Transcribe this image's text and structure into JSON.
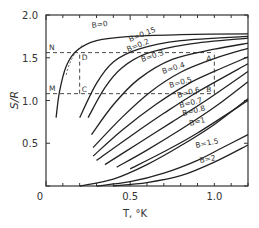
{
  "chart_data": {
    "type": "line",
    "title": "",
    "xlabel": "T, °K",
    "ylabel": "S/R",
    "xlim": [
      0,
      1.2
    ],
    "ylim": [
      0,
      2.0
    ],
    "x_ticks": [
      {
        "v": 0,
        "label": "0"
      },
      {
        "v": 0.5,
        "label": "0.5"
      },
      {
        "v": 1.0,
        "label": "1.0"
      }
    ],
    "y_ticks": [
      {
        "v": 0.5,
        "label": "0.5"
      },
      {
        "v": 1.0,
        "label": "1.0"
      },
      {
        "v": 1.5,
        "label": "1.5"
      },
      {
        "v": 2.0,
        "label": "2.0"
      }
    ],
    "grid": false,
    "series": [
      {
        "name": "B=0",
        "label": "B=0",
        "points": [
          [
            0.06,
            0.8
          ],
          [
            0.08,
            1.1
          ],
          [
            0.12,
            1.4
          ],
          [
            0.18,
            1.58
          ],
          [
            0.3,
            1.7
          ],
          [
            0.5,
            1.75
          ],
          [
            0.8,
            1.77
          ],
          [
            1.2,
            1.78
          ]
        ]
      },
      {
        "name": "B=0.15",
        "label": "B=0.15",
        "points": [
          [
            0.2,
            0.8
          ],
          [
            0.3,
            1.2
          ],
          [
            0.4,
            1.45
          ],
          [
            0.55,
            1.6
          ],
          [
            0.8,
            1.7
          ],
          [
            1.2,
            1.75
          ]
        ]
      },
      {
        "name": "B=0.2",
        "label": "B=0.2",
        "points": [
          [
            0.25,
            0.8
          ],
          [
            0.35,
            1.15
          ],
          [
            0.45,
            1.38
          ],
          [
            0.6,
            1.55
          ],
          [
            0.85,
            1.66
          ],
          [
            1.2,
            1.73
          ]
        ]
      },
      {
        "name": "B=0.3",
        "label": "B=0.3",
        "points": [
          [
            0.27,
            0.6
          ],
          [
            0.4,
            0.95
          ],
          [
            0.55,
            1.25
          ],
          [
            0.75,
            1.48
          ],
          [
            1.0,
            1.6
          ],
          [
            1.2,
            1.67
          ]
        ]
      },
      {
        "name": "B=0.4",
        "label": "B=0.4",
        "points": [
          [
            0.28,
            0.45
          ],
          [
            0.45,
            0.8
          ],
          [
            0.62,
            1.1
          ],
          [
            0.8,
            1.33
          ],
          [
            1.0,
            1.49
          ],
          [
            1.2,
            1.61
          ]
        ]
      },
      {
        "name": "B=0.5",
        "label": "B=0.5",
        "points": [
          [
            0.28,
            0.35
          ],
          [
            0.45,
            0.65
          ],
          [
            0.65,
            0.95
          ],
          [
            0.85,
            1.2
          ],
          [
            1.0,
            1.34
          ],
          [
            1.2,
            1.51
          ]
        ]
      },
      {
        "name": "B=0.6",
        "label": "B=0.6",
        "points": [
          [
            0.3,
            0.3
          ],
          [
            0.5,
            0.58
          ],
          [
            0.7,
            0.85
          ],
          [
            0.9,
            1.1
          ],
          [
            1.2,
            1.43
          ]
        ]
      },
      {
        "name": "B=0.7",
        "label": "B=0.7",
        "points": [
          [
            0.35,
            0.25
          ],
          [
            0.55,
            0.5
          ],
          [
            0.75,
            0.75
          ],
          [
            0.95,
            1.0
          ],
          [
            1.2,
            1.34
          ]
        ]
      },
      {
        "name": "B=0.8",
        "label": "B=0.8",
        "points": [
          [
            0.42,
            0.22
          ],
          [
            0.6,
            0.42
          ],
          [
            0.8,
            0.66
          ],
          [
            1.0,
            0.92
          ],
          [
            1.2,
            1.22
          ]
        ]
      },
      {
        "name": "B=0.9",
        "label": "",
        "points": [
          [
            0.5,
            0.2
          ],
          [
            0.7,
            0.4
          ],
          [
            0.9,
            0.62
          ],
          [
            1.2,
            1.0
          ]
        ]
      },
      {
        "name": "B=1",
        "label": "B=1",
        "points": [
          [
            0.2,
            0.0
          ],
          [
            0.4,
            0.08
          ],
          [
            0.6,
            0.25
          ],
          [
            0.8,
            0.47
          ],
          [
            1.0,
            0.72
          ],
          [
            1.2,
            1.02
          ]
        ]
      },
      {
        "name": "B=1.5",
        "label": "B=1.5",
        "points": [
          [
            0.3,
            0.0
          ],
          [
            0.5,
            0.05
          ],
          [
            0.7,
            0.15
          ],
          [
            0.9,
            0.3
          ],
          [
            1.05,
            0.45
          ],
          [
            1.2,
            0.6
          ]
        ]
      },
      {
        "name": "B=2",
        "label": "B=2",
        "points": [
          [
            0.4,
            0.0
          ],
          [
            0.6,
            0.04
          ],
          [
            0.8,
            0.12
          ],
          [
            1.0,
            0.28
          ],
          [
            1.2,
            0.48
          ]
        ]
      }
    ],
    "annotations": [
      {
        "text": "N",
        "x": 0.0,
        "y": 1.56
      },
      {
        "text": "M",
        "x": 0.0,
        "y": 1.08
      },
      {
        "text": "D",
        "x": 0.2,
        "y": 1.56
      },
      {
        "text": "C",
        "x": 0.2,
        "y": 1.08
      },
      {
        "text": "A",
        "x": 1.0,
        "y": 1.56
      },
      {
        "text": "B",
        "x": 1.0,
        "y": 1.08
      }
    ],
    "dashed_lines": [
      {
        "from": [
          0,
          1.56
        ],
        "to": [
          1.0,
          1.56
        ]
      },
      {
        "from": [
          0,
          1.08
        ],
        "to": [
          1.0,
          1.08
        ]
      },
      {
        "from": [
          0.2,
          1.08
        ],
        "to": [
          0.2,
          1.56
        ]
      },
      {
        "from": [
          1.0,
          1.08
        ],
        "to": [
          1.0,
          1.56
        ]
      }
    ]
  }
}
